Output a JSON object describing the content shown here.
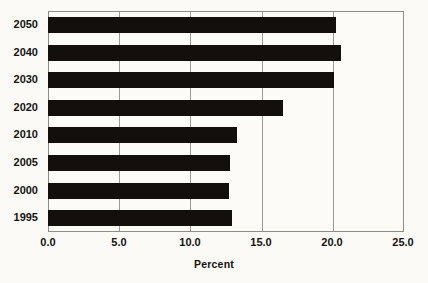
{
  "chart_data": {
    "type": "bar",
    "orientation": "horizontal",
    "title": "",
    "xlabel": "Percent",
    "ylabel": "",
    "categories": [
      "2050",
      "2040",
      "2030",
      "2020",
      "2010",
      "2005",
      "2000",
      "1995"
    ],
    "values": [
      20.2,
      20.6,
      20.1,
      16.5,
      13.3,
      12.8,
      12.7,
      12.9
    ],
    "xlim": [
      0.0,
      25.0
    ],
    "xticks": [
      "0.0",
      "5.0",
      "10.0",
      "15.0",
      "20.0",
      "25.0"
    ],
    "xtick_values": [
      0.0,
      5.0,
      10.0,
      15.0,
      20.0,
      25.0
    ],
    "grid": "vertical",
    "legend": null,
    "bar_color": "#120f0c",
    "plot_background": "#fcfbf8",
    "axis_color": "#8d8d86"
  },
  "axis": {
    "x_title": "Percent"
  }
}
